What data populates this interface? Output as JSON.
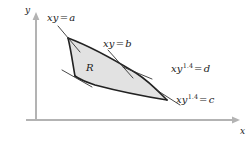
{
  "figure": {
    "background": "#ffffff",
    "region_fill": "#e2e2e2",
    "curve_color": "#222222",
    "axis_color": "#b3b3b3",
    "leader_color": "#333333"
  },
  "axes": {
    "x_label": "x",
    "y_label": "y",
    "origin": [
      36,
      120
    ],
    "x_end": [
      238,
      120
    ],
    "y_top": [
      36,
      14
    ]
  },
  "region": {
    "label": "R",
    "corners": {
      "top": [
        68,
        38
      ],
      "left": [
        75,
        76
      ],
      "right": [
        136,
        73
      ],
      "bottom_right": [
        167,
        100
      ]
    }
  },
  "curve_labels": [
    {
      "name": "xy-equals-a",
      "lhs": "xy",
      "op": "=",
      "rhs": "a",
      "exponent": "",
      "text": "xy = a"
    },
    {
      "name": "xy-equals-b",
      "lhs": "xy",
      "op": "=",
      "rhs": "b",
      "exponent": "",
      "text": "xy = b"
    },
    {
      "name": "xy14-equals-d",
      "lhs": "xy",
      "op": "=",
      "rhs": "d",
      "exponent": "1.4",
      "text": "xy1.4 = d"
    },
    {
      "name": "xy14-equals-c",
      "lhs": "xy",
      "op": "=",
      "rhs": "c",
      "exponent": "1.4",
      "text": "xy1.4 = c"
    }
  ]
}
